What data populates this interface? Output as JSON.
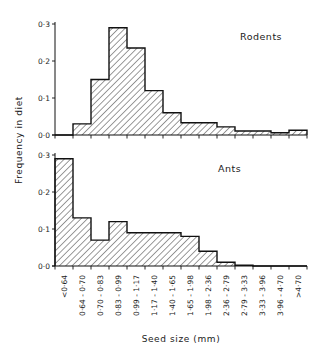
{
  "chart_data": [
    {
      "type": "bar",
      "title": "Rodents",
      "xlabel": "Seed size (mm)",
      "ylabel": "Frequency in diet",
      "ylim": [
        0,
        0.3
      ],
      "yticks": [
        "0·0",
        "0·1",
        "0·2",
        "0·3"
      ],
      "grid": false,
      "categories": [
        "<0·64",
        "0·64 - 0·70",
        "0·70 - 0·83",
        "0·83 - 0·99",
        "0·99 - 1·17",
        "1·17 - 1·40",
        "1·40 - 1·65",
        "1·65 - 1·98",
        "1·98 - 2·36",
        "2·36 - 2·79",
        "2·79 - 3·33",
        "3·33 - 3·96",
        "3·96 - 4·70",
        ">4·70"
      ],
      "values": [
        0.0,
        0.03,
        0.15,
        0.29,
        0.235,
        0.12,
        0.06,
        0.033,
        0.033,
        0.022,
        0.011,
        0.011,
        0.006,
        0.013
      ]
    },
    {
      "type": "bar",
      "title": "Ants",
      "xlabel": "Seed size (mm)",
      "ylabel": "Frequency in diet",
      "ylim": [
        0,
        0.3
      ],
      "yticks": [
        "0·0",
        "0·1",
        "0·2",
        "0·3"
      ],
      "grid": false,
      "categories": [
        "<0·64",
        "0·64 - 0·70",
        "0·70 - 0·83",
        "0·83 - 0·99",
        "0·99 - 1·17",
        "1·17 - 1·40",
        "1·40 - 1·65",
        "1·65 - 1·98",
        "1·98 - 2·36",
        "2·36 - 2·79",
        "2·79 - 3·33",
        "3·33 - 3·96",
        "3·96 - 4·70",
        ">4·70"
      ],
      "values": [
        0.29,
        0.13,
        0.07,
        0.12,
        0.09,
        0.09,
        0.09,
        0.08,
        0.04,
        0.01,
        0.002,
        0.0,
        0.0,
        0.0
      ]
    }
  ],
  "figure": {
    "ylabel": "Frequency in diet",
    "xlabel": "Seed size (mm)",
    "panels": [
      "Rodents",
      "Ants"
    ]
  }
}
